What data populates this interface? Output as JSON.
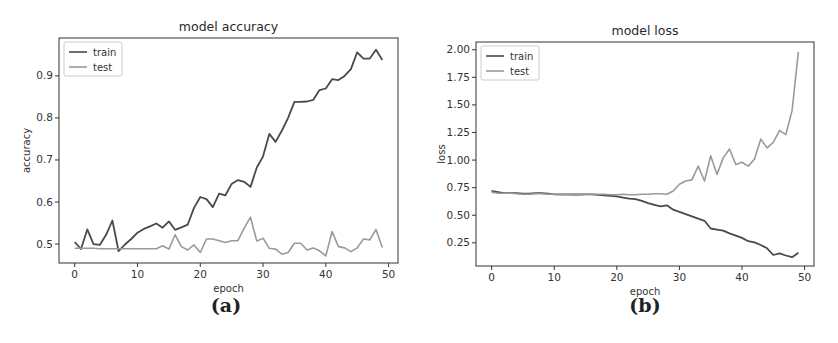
{
  "figure": {
    "caption_a": "(a)",
    "caption_b": "(b)"
  },
  "colors": {
    "train": "#4a4a4a",
    "test": "#9a9a9a",
    "frame": "#333333",
    "legend_border": "#cccccc"
  },
  "chart_data": [
    {
      "type": "line",
      "title": "model accuracy",
      "xlabel": "epoch",
      "ylabel": "accuracy",
      "xlim": [
        -2.5,
        51.5
      ],
      "ylim": [
        0.455,
        0.99
      ],
      "xticks": [
        0,
        10,
        20,
        30,
        40,
        50
      ],
      "xtick_labels": [
        "0",
        "10",
        "20",
        "30",
        "40",
        "50"
      ],
      "yticks": [
        0.5,
        0.6,
        0.7,
        0.8,
        0.9
      ],
      "ytick_labels": [
        "0.5",
        "0.6",
        "0.7",
        "0.8",
        "0.9"
      ],
      "grid": false,
      "legend_position": "upper left",
      "x": [
        0,
        1,
        2,
        3,
        4,
        5,
        6,
        7,
        8,
        9,
        10,
        11,
        12,
        13,
        14,
        15,
        16,
        17,
        18,
        19,
        20,
        21,
        22,
        23,
        24,
        25,
        26,
        27,
        28,
        29,
        30,
        31,
        32,
        33,
        34,
        35,
        36,
        37,
        38,
        39,
        40,
        41,
        42,
        43,
        44,
        45,
        46,
        47,
        48,
        49
      ],
      "series": [
        {
          "name": "train",
          "values": [
            0.505,
            0.488,
            0.535,
            0.5,
            0.498,
            0.522,
            0.556,
            0.483,
            0.499,
            0.512,
            0.527,
            0.536,
            0.542,
            0.549,
            0.539,
            0.554,
            0.534,
            0.54,
            0.546,
            0.586,
            0.612,
            0.607,
            0.588,
            0.62,
            0.616,
            0.643,
            0.652,
            0.648,
            0.636,
            0.682,
            0.708,
            0.762,
            0.743,
            0.77,
            0.8,
            0.838,
            0.838,
            0.839,
            0.843,
            0.866,
            0.87,
            0.892,
            0.89,
            0.9,
            0.916,
            0.956,
            0.941,
            0.941,
            0.962,
            0.938
          ]
        },
        {
          "name": "test",
          "values": [
            0.49,
            0.49,
            0.49,
            0.49,
            0.489,
            0.489,
            0.489,
            0.489,
            0.489,
            0.489,
            0.489,
            0.489,
            0.489,
            0.489,
            0.496,
            0.488,
            0.522,
            0.494,
            0.486,
            0.498,
            0.48,
            0.512,
            0.512,
            0.508,
            0.504,
            0.508,
            0.508,
            0.538,
            0.564,
            0.507,
            0.514,
            0.49,
            0.488,
            0.476,
            0.48,
            0.502,
            0.502,
            0.486,
            0.491,
            0.484,
            0.472,
            0.53,
            0.494,
            0.491,
            0.482,
            0.491,
            0.512,
            0.51,
            0.535,
            0.492
          ]
        }
      ]
    },
    {
      "type": "line",
      "title": "model loss",
      "xlabel": "epoch",
      "ylabel": "loss",
      "xlim": [
        -2.5,
        51.5
      ],
      "ylim": [
        0.04,
        2.07
      ],
      "xticks": [
        0,
        10,
        20,
        30,
        40,
        50
      ],
      "xtick_labels": [
        "0",
        "10",
        "20",
        "30",
        "40",
        "50"
      ],
      "yticks": [
        0.25,
        0.5,
        0.75,
        1.0,
        1.25,
        1.5,
        1.75,
        2.0
      ],
      "ytick_labels": [
        "0.25",
        "0.50",
        "0.75",
        "1.00",
        "1.25",
        "1.50",
        "1.75",
        "2.00"
      ],
      "grid": false,
      "legend_position": "upper left",
      "x": [
        0,
        1,
        2,
        3,
        4,
        5,
        6,
        7,
        8,
        9,
        10,
        11,
        12,
        13,
        14,
        15,
        16,
        17,
        18,
        19,
        20,
        21,
        22,
        23,
        24,
        25,
        26,
        27,
        28,
        29,
        30,
        31,
        32,
        33,
        34,
        35,
        36,
        37,
        38,
        39,
        40,
        41,
        42,
        43,
        44,
        45,
        46,
        47,
        48,
        49
      ],
      "series": [
        {
          "name": "train",
          "values": [
            0.72,
            0.71,
            0.7,
            0.7,
            0.7,
            0.695,
            0.695,
            0.7,
            0.7,
            0.695,
            0.69,
            0.69,
            0.69,
            0.688,
            0.688,
            0.69,
            0.69,
            0.685,
            0.68,
            0.675,
            0.672,
            0.66,
            0.65,
            0.645,
            0.63,
            0.61,
            0.595,
            0.58,
            0.59,
            0.55,
            0.53,
            0.51,
            0.49,
            0.47,
            0.45,
            0.38,
            0.37,
            0.36,
            0.335,
            0.315,
            0.295,
            0.265,
            0.255,
            0.23,
            0.2,
            0.14,
            0.155,
            0.135,
            0.12,
            0.16
          ]
        },
        {
          "name": "test",
          "values": [
            0.71,
            0.7,
            0.7,
            0.7,
            0.695,
            0.69,
            0.69,
            0.695,
            0.695,
            0.69,
            0.69,
            0.685,
            0.685,
            0.685,
            0.685,
            0.69,
            0.69,
            0.69,
            0.69,
            0.685,
            0.685,
            0.69,
            0.685,
            0.685,
            0.69,
            0.69,
            0.695,
            0.695,
            0.69,
            0.72,
            0.78,
            0.81,
            0.82,
            0.945,
            0.81,
            1.04,
            0.87,
            1.02,
            1.1,
            0.96,
            0.98,
            0.945,
            1.01,
            1.19,
            1.11,
            1.16,
            1.27,
            1.23,
            1.45,
            1.98
          ]
        }
      ]
    }
  ]
}
